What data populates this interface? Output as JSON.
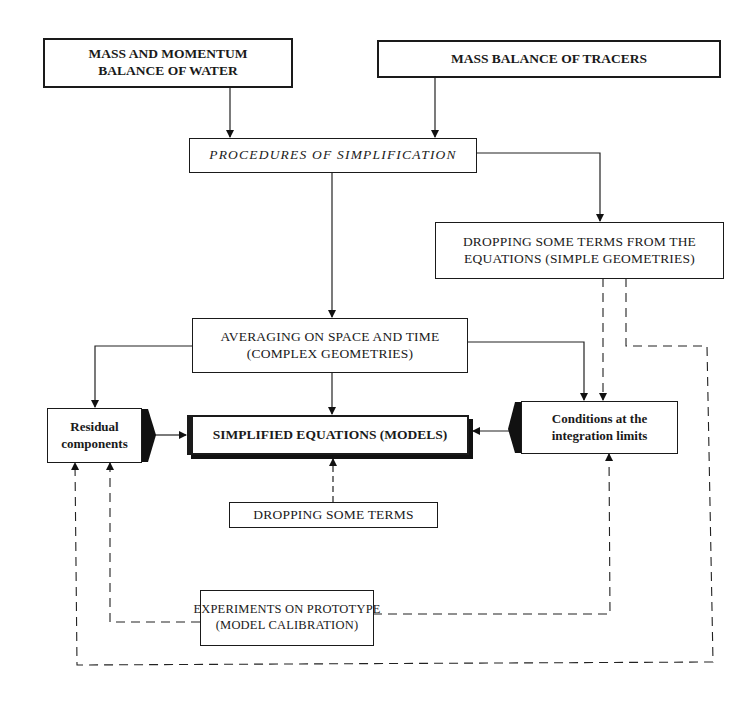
{
  "diagram": {
    "type": "flowchart",
    "nodes": {
      "mass_momentum_water": {
        "line1": "MASS AND MOMENTUM",
        "line2": "BALANCE OF WATER"
      },
      "mass_balance_tracers": {
        "line1": "MASS BALANCE OF TRACERS"
      },
      "procedures_simplification": {
        "line1": "PROCEDURES OF SIMPLIFICATION"
      },
      "dropping_terms_simple": {
        "line1": "DROPPING SOME TERMS FROM THE",
        "line2": "EQUATIONS  (SIMPLE GEOMETRIES)"
      },
      "averaging_space_time": {
        "line1": "AVERAGING ON SPACE AND TIME",
        "line2": "(COMPLEX GEOMETRIES)"
      },
      "residual_components": {
        "line1": "Residual",
        "line2": "components"
      },
      "simplified_equations": {
        "line1": "SIMPLIFIED EQUATIONS (MODELS)"
      },
      "conditions_limits": {
        "line1": "Conditions at the",
        "line2": "integration  limits"
      },
      "dropping_some_terms": {
        "line1": "DROPPING SOME TERMS"
      },
      "experiments_prototype": {
        "line1": "EXPERIMENTS ON PROTOTYPE",
        "line2": "(MODEL CALIBRATION)"
      }
    },
    "edges": [
      {
        "from": "mass_momentum_water",
        "to": "procedures_simplification",
        "style": "solid"
      },
      {
        "from": "mass_balance_tracers",
        "to": "procedures_simplification",
        "style": "solid"
      },
      {
        "from": "procedures_simplification",
        "to": "dropping_terms_simple",
        "style": "solid"
      },
      {
        "from": "procedures_simplification",
        "to": "averaging_space_time",
        "style": "solid"
      },
      {
        "from": "averaging_space_time",
        "to": "residual_components",
        "style": "solid"
      },
      {
        "from": "averaging_space_time",
        "to": "simplified_equations",
        "style": "solid"
      },
      {
        "from": "averaging_space_time",
        "to": "conditions_limits",
        "style": "solid"
      },
      {
        "from": "dropping_terms_simple",
        "to": "conditions_limits",
        "style": "dashed"
      },
      {
        "from": "dropping_terms_simple",
        "to": "residual_components",
        "style": "dashed"
      },
      {
        "from": "residual_components",
        "to": "simplified_equations",
        "style": "solid"
      },
      {
        "from": "conditions_limits",
        "to": "simplified_equations",
        "style": "solid"
      },
      {
        "from": "dropping_some_terms",
        "to": "simplified_equations",
        "style": "dashed"
      },
      {
        "from": "experiments_prototype",
        "to": "residual_components",
        "style": "dashed"
      },
      {
        "from": "experiments_prototype",
        "to": "conditions_limits",
        "style": "dashed"
      }
    ]
  }
}
